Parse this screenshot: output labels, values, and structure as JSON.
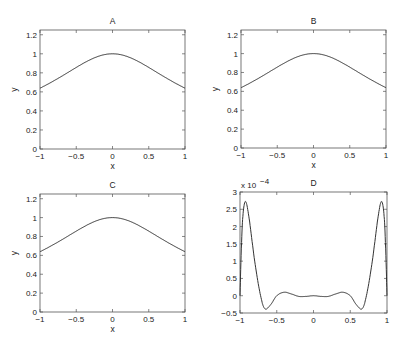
{
  "chart_data": [
    {
      "type": "line",
      "title": "A",
      "xlabel": "x",
      "ylabel": "y",
      "xlim": [
        -1,
        1
      ],
      "ylim": [
        0,
        1.25
      ],
      "xticks": [
        "-1",
        "-0.5",
        "0",
        "0.5",
        "1"
      ],
      "yticks": [
        "0",
        "0.2",
        "0.4",
        "0.6",
        "0.8",
        "1",
        "1.2"
      ],
      "grid": false,
      "series": [
        {
          "name": "f(x)",
          "x": [
            -1,
            -0.75,
            -0.5,
            -0.25,
            0,
            0.25,
            0.5,
            0.75,
            1
          ],
          "values": [
            0.64,
            0.75,
            0.86,
            0.96,
            1.0,
            0.96,
            0.86,
            0.75,
            0.64
          ]
        }
      ]
    },
    {
      "type": "line",
      "title": "B",
      "xlabel": "x",
      "ylabel": "y",
      "xlim": [
        -1,
        1
      ],
      "ylim": [
        0,
        1.25
      ],
      "xticks": [
        "-1",
        "-0.5",
        "0",
        "0.5",
        "1"
      ],
      "yticks": [
        "0",
        "0.2",
        "0.4",
        "0.6",
        "0.8",
        "1",
        "1.2"
      ],
      "grid": false,
      "series": [
        {
          "name": "f(x)",
          "x": [
            -1,
            -0.75,
            -0.5,
            -0.25,
            0,
            0.25,
            0.5,
            0.75,
            1
          ],
          "values": [
            0.64,
            0.75,
            0.86,
            0.96,
            1.0,
            0.96,
            0.86,
            0.75,
            0.64
          ]
        }
      ]
    },
    {
      "type": "line",
      "title": "C",
      "xlabel": "x",
      "ylabel": "y",
      "xlim": [
        -1,
        1
      ],
      "ylim": [
        0,
        1.25
      ],
      "xticks": [
        "-1",
        "-0.5",
        "0",
        "0.5",
        "1"
      ],
      "yticks": [
        "0",
        "0.2",
        "0.4",
        "0.6",
        "0.8",
        "1",
        "1.2"
      ],
      "grid": false,
      "series": [
        {
          "name": "f(x)",
          "x": [
            -1,
            -0.75,
            -0.5,
            -0.25,
            0,
            0.25,
            0.5,
            0.75,
            1
          ],
          "values": [
            0.64,
            0.75,
            0.86,
            0.96,
            1.0,
            0.96,
            0.86,
            0.75,
            0.64
          ]
        }
      ]
    },
    {
      "type": "line",
      "title": "D",
      "xlabel": "",
      "ylabel": "",
      "xlim": [
        -1,
        1
      ],
      "ylim": [
        -0.5,
        3
      ],
      "y_scale_label": "x 10^-4",
      "xticks": [
        "-1",
        "-0.5",
        "0",
        "0.5",
        "1"
      ],
      "yticks": [
        "-0.5",
        "0",
        "0.5",
        "1",
        "1.5",
        "2",
        "2.5",
        "3"
      ],
      "grid": false,
      "series": [
        {
          "name": "error (x1e-4)",
          "x": [
            -1,
            -0.97,
            -0.93,
            -0.88,
            -0.8,
            -0.72,
            -0.66,
            -0.58,
            -0.5,
            -0.4,
            -0.3,
            -0.2,
            -0.1,
            0,
            0.1,
            0.2,
            0.3,
            0.4,
            0.5,
            0.58,
            0.66,
            0.72,
            0.8,
            0.88,
            0.93,
            0.97,
            1
          ],
          "values": [
            0,
            2.0,
            2.72,
            2.3,
            1.0,
            0.0,
            -0.38,
            -0.25,
            0.0,
            0.1,
            0.05,
            -0.02,
            -0.02,
            0.0,
            -0.02,
            -0.02,
            0.05,
            0.1,
            0.0,
            -0.25,
            -0.38,
            0.0,
            1.0,
            2.3,
            2.72,
            2.0,
            0
          ]
        }
      ]
    }
  ]
}
